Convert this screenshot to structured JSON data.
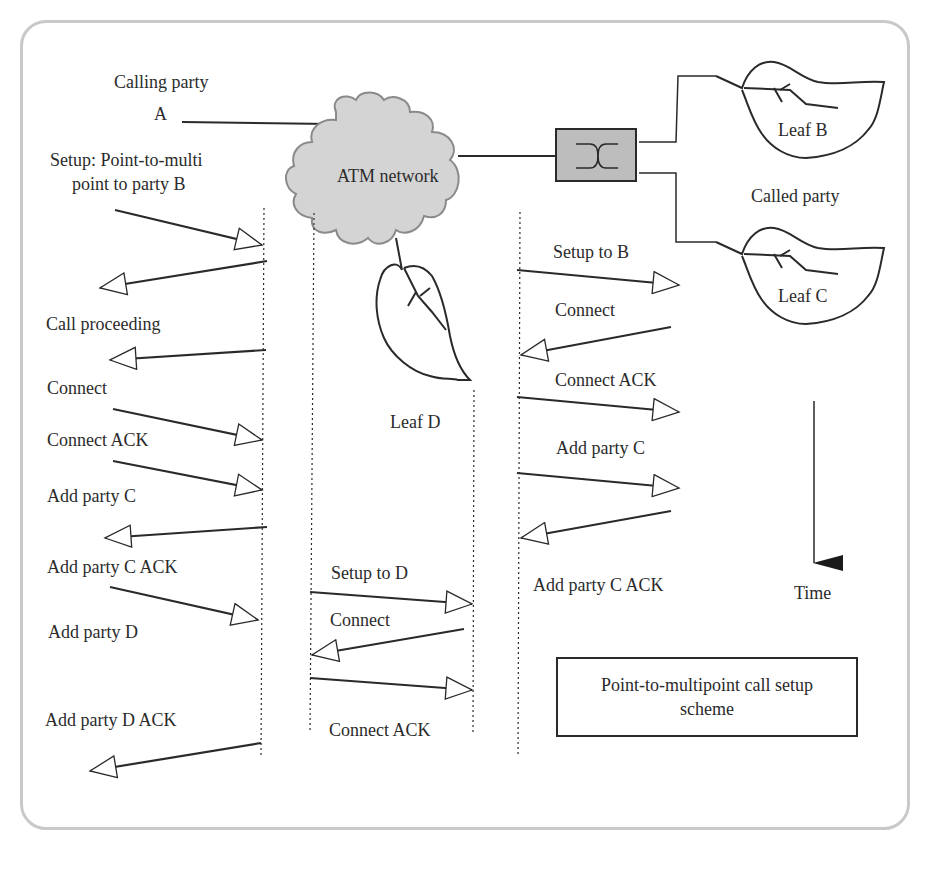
{
  "diagram": {
    "title_box": {
      "line1": "Point-to-multipoint call setup",
      "line2": "scheme"
    },
    "network": {
      "label": "ATM network"
    },
    "parties": {
      "calling_label": "Calling  party",
      "calling_id": "A",
      "called_label": "Called  party",
      "leaf_b": "Leaf B",
      "leaf_c": "Leaf C",
      "leaf_d": "Leaf D"
    },
    "time_axis": {
      "label": "Time"
    },
    "messages_left": [
      {
        "label_line1": "Setup: Point-to-multi",
        "label_line2": "point to party B",
        "direction": "right"
      },
      {
        "label": "Call proceeding",
        "direction": "left"
      },
      {
        "label": "Connect",
        "direction": "left"
      },
      {
        "label": "Connect  ACK",
        "direction": "right"
      },
      {
        "label": "Add party C",
        "direction": "right"
      },
      {
        "label": "Add party C ACK",
        "direction": "left"
      },
      {
        "label": "Add party  D",
        "direction": "right"
      },
      {
        "label": "Add party D ACK",
        "direction": "left"
      }
    ],
    "messages_middle": [
      {
        "label": "Setup to D",
        "direction": "right"
      },
      {
        "label": "Connect",
        "direction": "left"
      },
      {
        "label": "Connect ACK",
        "direction": "right"
      }
    ],
    "messages_right": [
      {
        "label": "Setup to B",
        "direction": "right"
      },
      {
        "label": "Connect",
        "direction": "left"
      },
      {
        "label": "Connect  ACK",
        "direction": "right"
      },
      {
        "label": "Add party C",
        "direction": "right"
      },
      {
        "label": "Add party C ACK",
        "direction": "left"
      }
    ],
    "colors": {
      "line": "#2a2a2a",
      "cloud_fill": "#d4d4d4",
      "switch_fill": "#bdbdbd",
      "frame": "#c9c9c9"
    }
  }
}
